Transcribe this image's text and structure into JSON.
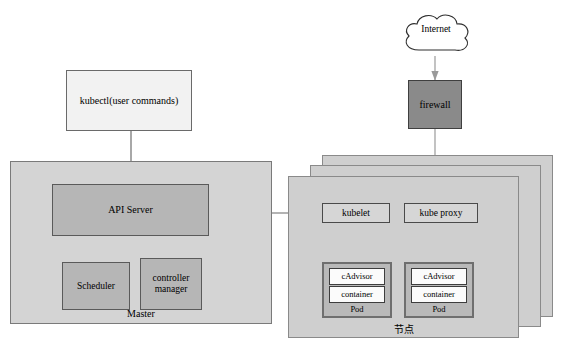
{
  "diagram": {
    "internet": {
      "label": "Internet"
    },
    "firewall": {
      "label": "firewall"
    },
    "kubectl": {
      "label": "kubectl(user commands)"
    },
    "master": {
      "label": "Master",
      "api_server": "API Server",
      "scheduler": "Scheduler",
      "controller_manager": "controller manager"
    },
    "node": {
      "label": "节点",
      "kubelet": "kubelet",
      "kube_proxy": "kube proxy",
      "pods": [
        {
          "label": "Pod",
          "cadvisor": "cAdvisor",
          "container": "container"
        },
        {
          "label": "Pod",
          "cadvisor": "cAdvisor",
          "container": "container"
        }
      ]
    },
    "colors": {
      "page_background": "#ffffff",
      "master_fill": "#d4d4d4",
      "node_fill": "#cfcfcf",
      "component_fill": "#b6b6b6",
      "firewall_fill": "#8a8a8a",
      "pod_fill": "#b9b9b9",
      "pod_inner_fill": "#fbfbfb",
      "white_box_fill": "#f2f2f2",
      "connector_dark": "#000000",
      "connector_light": "#9a9a9a"
    }
  }
}
